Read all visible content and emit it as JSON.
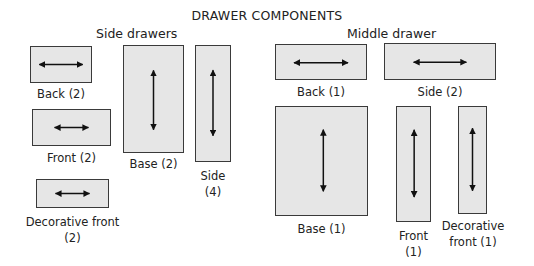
{
  "title": "DRAWER COMPONENTS",
  "groups": {
    "side": {
      "label": "Side drawers",
      "parts": [
        {
          "name": "Back",
          "qty": "(2)",
          "caption": "Back (2)",
          "grain": "horizontal"
        },
        {
          "name": "Front",
          "qty": "(2)",
          "caption": "Front (2)",
          "grain": "horizontal"
        },
        {
          "name": "Decorative front",
          "qty": "(2)",
          "caption_line1": "Decorative front",
          "caption_line2": "(2)",
          "grain": "horizontal"
        },
        {
          "name": "Base",
          "qty": "(2)",
          "caption": "Base (2)",
          "grain": "vertical"
        },
        {
          "name": "Side",
          "qty": "(4)",
          "caption_line1": "Side",
          "caption_line2": "(4)",
          "grain": "vertical"
        }
      ]
    },
    "middle": {
      "label": "Middle drawer",
      "parts": [
        {
          "name": "Back",
          "qty": "(1)",
          "caption": "Back (1)",
          "grain": "horizontal"
        },
        {
          "name": "Side",
          "qty": "(2)",
          "caption": "Side (2)",
          "grain": "horizontal"
        },
        {
          "name": "Base",
          "qty": "(1)",
          "caption": "Base (1)",
          "grain": "vertical"
        },
        {
          "name": "Front",
          "qty": "(1)",
          "caption_line1": "Front",
          "caption_line2": "(1)",
          "grain": "vertical"
        },
        {
          "name": "Decorative front",
          "qty": "(1)",
          "caption_line1": "Decorative",
          "caption_line2": "front (1)",
          "grain": "vertical"
        }
      ]
    }
  },
  "colors": {
    "panel_fill": "#e6e6e6",
    "panel_border": "#3a3a3a",
    "arrow": "#111111"
  }
}
